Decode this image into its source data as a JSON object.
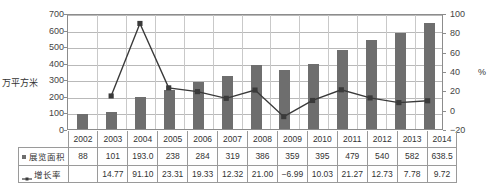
{
  "chart_data": {
    "type": "bar",
    "title": "",
    "xlabel": "",
    "ylabel": "万平方米",
    "ylabel_right": "%",
    "ylim": [
      0,
      700
    ],
    "ylim_right": [
      -20,
      100
    ],
    "yticks": [
      700,
      600,
      500,
      400,
      300,
      200,
      100,
      0
    ],
    "yticks_right": [
      100,
      80,
      60,
      40,
      20,
      0,
      -20
    ],
    "grid": true,
    "legend_position": "table-left",
    "categories": [
      "2002",
      "2003",
      "2004",
      "2005",
      "2006",
      "2007",
      "2008",
      "2009",
      "2010",
      "2011",
      "2012",
      "2013",
      "2014"
    ],
    "series": [
      {
        "name": "展览面积",
        "type": "bar",
        "axis": "left",
        "color": "#6e6e6e",
        "marker": "square",
        "values": [
          88,
          101,
          193.0,
          238,
          284,
          319,
          386,
          359,
          395,
          479,
          540,
          582,
          638.5
        ],
        "labels": [
          "88",
          "101",
          "193.0",
          "238",
          "284",
          "319",
          "386",
          "359",
          "395",
          "479",
          "540",
          "582",
          "638.5"
        ]
      },
      {
        "name": "增长率",
        "type": "line",
        "axis": "right",
        "color": "#3a3a3a",
        "marker": "square",
        "values": [
          null,
          14.77,
          91.1,
          23.31,
          19.33,
          12.32,
          21.0,
          -6.99,
          10.03,
          21.27,
          12.73,
          7.78,
          9.72
        ],
        "labels": [
          "",
          "14.77",
          "91.10",
          "23.31",
          "19.33",
          "12.32",
          "21.00",
          "−6.99",
          "10.03",
          "21.27",
          "12.73",
          "7.78",
          "9.72"
        ]
      }
    ]
  },
  "colors": {
    "bar": "#6e6e6e",
    "line": "#3a3a3a",
    "grid": "#b9b9b9",
    "axis": "#8c8c8c",
    "text": "#333333"
  }
}
